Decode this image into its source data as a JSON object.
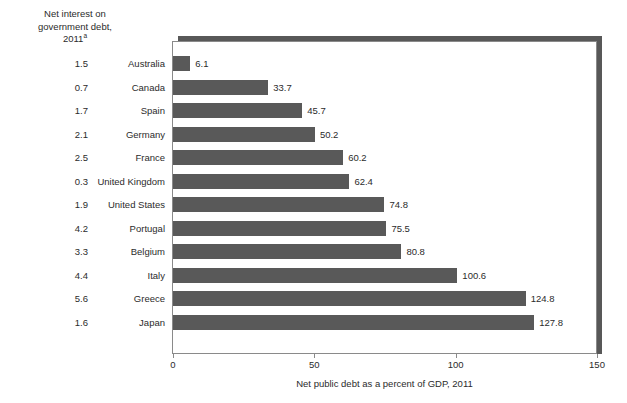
{
  "left_header": {
    "line1": "Net interest on",
    "line2": "government debt,",
    "line3": "2011",
    "footnote_marker": "a"
  },
  "x_axis": {
    "title": "Net public debt as a percent of GDP, 2011",
    "ticks": [
      "0",
      "50",
      "100",
      "150"
    ]
  },
  "chart_data": {
    "type": "bar",
    "orientation": "horizontal",
    "title": "",
    "xlabel": "Net public debt as a percent of GDP, 2011",
    "ylabel": "",
    "xlim": [
      0,
      150
    ],
    "xticks": [
      0,
      50,
      100,
      150
    ],
    "grid": false,
    "legend": null,
    "bar_color": "#595959",
    "categories": [
      "Australia",
      "Canada",
      "Spain",
      "Germany",
      "France",
      "United Kingdom",
      "United States",
      "Portugal",
      "Belgium",
      "Italy",
      "Greece",
      "Japan"
    ],
    "values": [
      6.1,
      33.7,
      45.7,
      50.2,
      60.2,
      62.4,
      74.8,
      75.5,
      80.8,
      100.6,
      124.8,
      127.8
    ],
    "value_labels": [
      "6.1",
      "33.7",
      "45.7",
      "50.2",
      "60.2",
      "62.4",
      "74.8",
      "75.5",
      "80.8",
      "100.6",
      "124.8",
      "127.8"
    ],
    "secondary_series": {
      "name": "Net interest on government debt, 2011",
      "values": [
        1.5,
        0.7,
        1.7,
        2.1,
        2.5,
        0.3,
        1.9,
        4.2,
        3.3,
        4.4,
        5.6,
        1.6
      ],
      "labels": [
        "1.5",
        "0.7",
        "1.7",
        "2.1",
        "2.5",
        "0.3",
        "1.9",
        "4.2",
        "3.3",
        "4.4",
        "5.6",
        "1.6"
      ]
    }
  }
}
